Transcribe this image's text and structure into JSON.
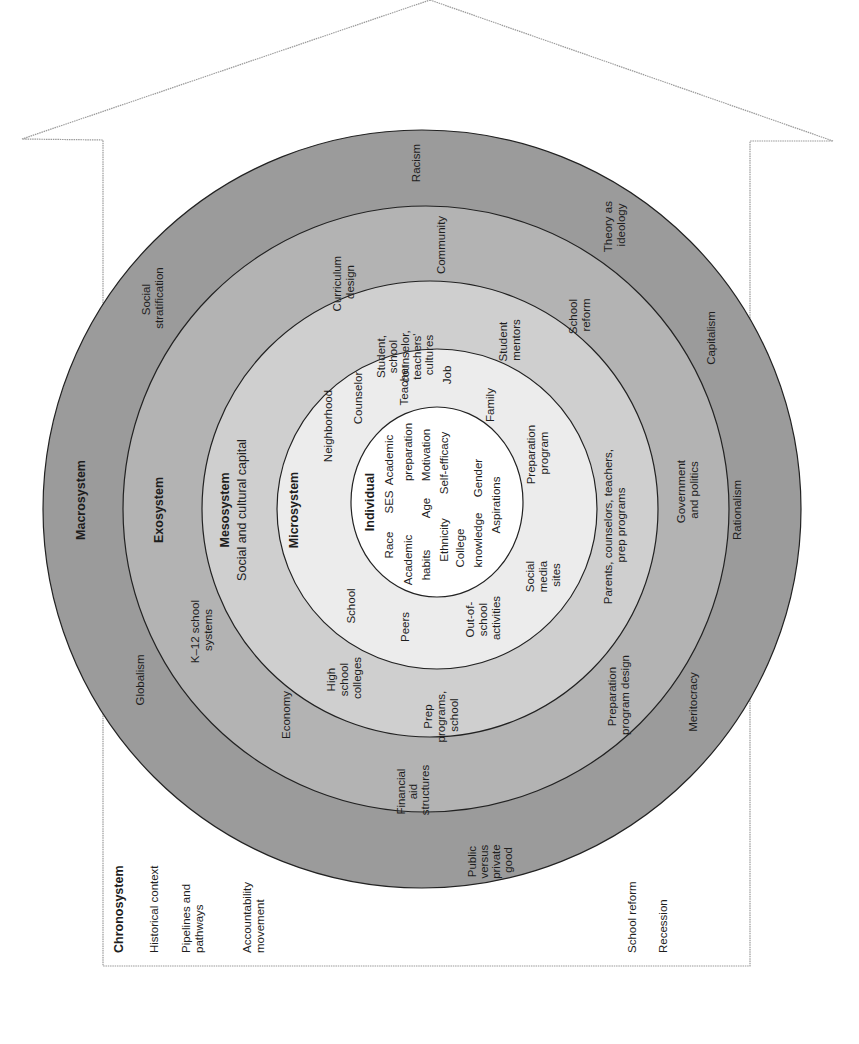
{
  "colors": {
    "background": "#ffffff",
    "outline": "#9a9a9a",
    "macrosystem_fill": "#9b9b9b",
    "exosystem_fill": "#b3b3b3",
    "mesosystem_fill": "#cfcfcf",
    "microsystem_fill": "#ececec",
    "individual_fill": "#ffffff",
    "ring_stroke": "#222222",
    "text": "#1e1e1e"
  },
  "orientation": "rotated 90 degrees counter-clockwise (text reads bottom-to-top)",
  "chronosystem": {
    "title": "Chronosystem",
    "items_left": [
      "Historical context",
      "Pipelines and",
      "pathways",
      "Accountability",
      "movement"
    ],
    "items_right": [
      "School reform",
      "Recession"
    ]
  },
  "macrosystem": {
    "title": "Macrosystem",
    "items": {
      "racism": "Racism",
      "social_stratification": [
        "Social",
        "stratification"
      ],
      "theory_as_ideology": [
        "Theory as",
        "ideology"
      ],
      "capitalism": "Capitalism",
      "rationalism": "Rationalism",
      "meritocracy": "Meritocracy",
      "public_versus_private_good": [
        "Public",
        "versus",
        "private",
        "good"
      ],
      "globalism": "Globalism"
    }
  },
  "exosystem": {
    "title": "Exosystem",
    "items": {
      "curriculum_design": [
        "Curriculum",
        "design"
      ],
      "community": "Community",
      "school_reform": [
        "School",
        "reform"
      ],
      "government_and_politics": [
        "Government",
        "and politics"
      ],
      "preparation_program_design": [
        "Preparation",
        "program design"
      ],
      "financial_aid_structures": [
        "Financial",
        "aid",
        "structures"
      ],
      "economy": "Economy",
      "k12_school_systems": [
        "K–12 school",
        "systems"
      ]
    }
  },
  "mesosystem": {
    "title": "Mesosystem",
    "subtitle": "Social and cultural capital",
    "items": {
      "student_counselor_teachers_cultures": [
        "Student,",
        "school",
        "counselor,",
        "teachers'",
        "cultures"
      ],
      "student_mentors": [
        "Student",
        "mentors"
      ],
      "parents_counselors_teachers_prep": [
        "Parents, counselors, teachers,",
        "prep programs"
      ],
      "prep_programs_school": [
        "Prep",
        "programs,",
        "school"
      ],
      "high_school_colleges": [
        "High",
        "school",
        "colleges"
      ]
    }
  },
  "microsystem": {
    "title": "Microsystem",
    "items": {
      "neighborhood": "Neighborhood",
      "counselor": "Counselor",
      "teacher": "Teacher",
      "job": "Job",
      "family": "Family",
      "preparation_program": [
        "Preparation",
        "program"
      ],
      "social_media_sites": [
        "Social",
        "media",
        "sites"
      ],
      "out_of_school_activities": [
        "Out-of-",
        "school",
        "activities"
      ],
      "peers": "Peers",
      "school": "School"
    }
  },
  "individual": {
    "title": "Individual",
    "rows": [
      [
        "Race",
        "SES",
        "Academic"
      ],
      [
        "Academic",
        "preparation"
      ],
      [
        "habits",
        "Age",
        "Motivation"
      ],
      [
        "Ethnicity",
        "Self-efficacy"
      ],
      [
        "College",
        "Gender"
      ],
      [
        "knowledge",
        "Aspirations"
      ]
    ]
  }
}
